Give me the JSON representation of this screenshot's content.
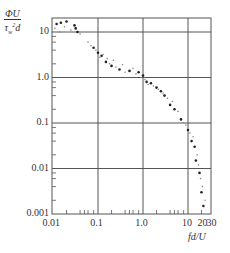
{
  "chart_data": {
    "type": "scatter",
    "title": "",
    "xlabel": "fd/U",
    "ylabel_num": "ΦU",
    "ylabel_den": "τ_w²d",
    "xscale": "log",
    "yscale": "log",
    "xlim": [
      0.01,
      30
    ],
    "ylim": [
      0.001,
      20
    ],
    "grid": true,
    "x_ticks": [
      {
        "value": 0.01,
        "label": "0.01"
      },
      {
        "value": 0.1,
        "label": "0.1"
      },
      {
        "value": 1.0,
        "label": "1.0"
      },
      {
        "value": 10,
        "label": "10"
      },
      {
        "value": 20,
        "label": "20"
      },
      {
        "value": 30,
        "label": "30"
      }
    ],
    "y_ticks": [
      {
        "value": 10,
        "label": "10"
      },
      {
        "value": 1.0,
        "label": "1.0"
      },
      {
        "value": 0.1,
        "label": "0.1"
      },
      {
        "value": 0.01,
        "label": "0.01"
      },
      {
        "value": 0.001,
        "label": "0.001"
      }
    ],
    "series": [
      {
        "name": "filled markers",
        "marker": "filled",
        "points": [
          [
            0.012,
            15
          ],
          [
            0.015,
            16
          ],
          [
            0.02,
            17
          ],
          [
            0.03,
            14
          ],
          [
            0.032,
            12
          ],
          [
            0.035,
            10
          ],
          [
            0.08,
            4.5
          ],
          [
            0.1,
            3.5
          ],
          [
            0.12,
            3.0
          ],
          [
            0.15,
            2.2
          ],
          [
            0.2,
            1.8
          ],
          [
            0.3,
            1.5
          ],
          [
            0.5,
            1.4
          ],
          [
            0.8,
            1.3
          ],
          [
            1.0,
            1.1
          ],
          [
            1.2,
            0.8
          ],
          [
            1.5,
            0.75
          ],
          [
            2.0,
            0.6
          ],
          [
            2.5,
            0.5
          ],
          [
            3.0,
            0.4
          ],
          [
            4.0,
            0.25
          ],
          [
            5.0,
            0.2
          ],
          [
            7.0,
            0.12
          ],
          [
            10,
            0.07
          ],
          [
            12,
            0.04
          ],
          [
            14,
            0.03
          ],
          [
            15,
            0.015
          ],
          [
            18,
            0.008
          ],
          [
            20,
            0.003
          ],
          [
            22,
            0.0015
          ]
        ]
      },
      {
        "name": "open markers",
        "marker": "dot",
        "points": [
          [
            0.011,
            12
          ],
          [
            0.014,
            10
          ],
          [
            0.018,
            13
          ],
          [
            0.025,
            11
          ],
          [
            0.04,
            9
          ],
          [
            0.06,
            6
          ],
          [
            0.07,
            5
          ],
          [
            0.09,
            4
          ],
          [
            0.11,
            2.8
          ],
          [
            0.13,
            3.2
          ],
          [
            0.16,
            2.6
          ],
          [
            0.18,
            2.0
          ],
          [
            0.22,
            2.4
          ],
          [
            0.25,
            1.7
          ],
          [
            0.35,
            1.9
          ],
          [
            0.4,
            1.3
          ],
          [
            0.6,
            1.6
          ],
          [
            0.7,
            1.2
          ],
          [
            0.9,
            1.0
          ],
          [
            1.1,
            0.9
          ],
          [
            1.3,
            0.7
          ],
          [
            1.7,
            0.65
          ],
          [
            2.2,
            0.55
          ],
          [
            2.8,
            0.45
          ],
          [
            3.5,
            0.35
          ],
          [
            4.5,
            0.3
          ],
          [
            6.0,
            0.18
          ],
          [
            8.0,
            0.1
          ],
          [
            9.0,
            0.09
          ],
          [
            11,
            0.06
          ],
          [
            13,
            0.05
          ],
          [
            16,
            0.02
          ],
          [
            17,
            0.012
          ],
          [
            19,
            0.006
          ],
          [
            21,
            0.004
          ],
          [
            24,
            0.002
          ]
        ]
      }
    ]
  }
}
